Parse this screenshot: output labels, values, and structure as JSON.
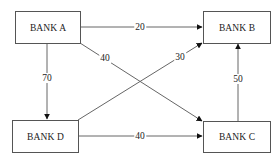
{
  "nodes": {
    "a": {
      "label": "BANK A"
    },
    "b": {
      "label": "BANK B"
    },
    "c": {
      "label": "BANK C"
    },
    "d": {
      "label": "BANK D"
    }
  },
  "edges": [
    {
      "from": "BANK A",
      "to": "BANK B",
      "value": "20"
    },
    {
      "from": "BANK A",
      "to": "BANK C",
      "value": "40"
    },
    {
      "from": "BANK A",
      "to": "BANK D",
      "value": "70"
    },
    {
      "from": "BANK D",
      "to": "BANK B",
      "value": "30"
    },
    {
      "from": "BANK D",
      "to": "BANK C",
      "value": "40"
    },
    {
      "from": "BANK C",
      "to": "BANK B",
      "value": "50"
    }
  ],
  "colors": {
    "line": "#555555",
    "text": "#222222"
  }
}
